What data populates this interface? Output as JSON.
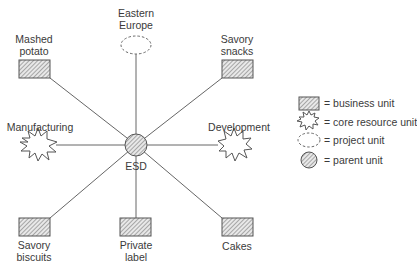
{
  "diagram": {
    "center": {
      "label": "ESD",
      "type": "parent unit"
    },
    "nodes": [
      {
        "id": "eastern-europe",
        "label_line1": "Eastern",
        "label_line2": "Europe",
        "type": "project unit"
      },
      {
        "id": "mashed-potato",
        "label_line1": "Mashed",
        "label_line2": "potato",
        "type": "business unit"
      },
      {
        "id": "savory-snacks",
        "label_line1": "Savory",
        "label_line2": "snacks",
        "type": "business unit"
      },
      {
        "id": "manufacturing",
        "label": "Manufacturing",
        "type": "core resource unit"
      },
      {
        "id": "development",
        "label": "Development",
        "type": "core resource unit"
      },
      {
        "id": "savory-biscuits",
        "label_line1": "Savory",
        "label_line2": "biscuits",
        "type": "business unit"
      },
      {
        "id": "private-label",
        "label_line1": "Private",
        "label_line2": "label",
        "type": "business unit"
      },
      {
        "id": "cakes",
        "label": "Cakes",
        "type": "business unit"
      }
    ],
    "legend": [
      {
        "symbol": "hatched-rectangle",
        "text": "= business unit"
      },
      {
        "symbol": "starburst",
        "text": "= core resource unit"
      },
      {
        "symbol": "dashed-ellipse",
        "text": "= project unit"
      },
      {
        "symbol": "hatched-circle",
        "text": "= parent unit"
      }
    ],
    "colors": {
      "stroke": "#555555",
      "hatch": "#777777",
      "fill": "#ffffff"
    }
  }
}
